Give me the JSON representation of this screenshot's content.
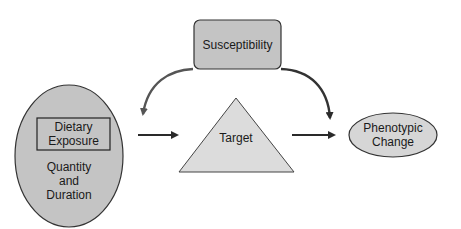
{
  "diagram": {
    "nodes": {
      "exposure": {
        "shape": "ellipse",
        "inner_box_label_line1": "Dietary",
        "inner_box_label_line2": "Exposure",
        "sub_label_line1": "Quantity",
        "sub_label_line2": "and",
        "sub_label_line3": "Duration"
      },
      "susceptibility": {
        "shape": "rounded-rectangle",
        "label": "Susceptibility"
      },
      "target": {
        "shape": "triangle",
        "label": "Target"
      },
      "phenotypic_change": {
        "shape": "ellipse",
        "label_line1": "Phenotypic",
        "label_line2": "Change"
      }
    },
    "edges": [
      {
        "from": "exposure",
        "to": "target",
        "style": "straight-arrow"
      },
      {
        "from": "target",
        "to": "phenotypic_change",
        "style": "straight-arrow"
      },
      {
        "from": "susceptibility",
        "to": "exposure-target-link",
        "style": "curved-arrow"
      },
      {
        "from": "susceptibility",
        "to": "target-phenotype-link",
        "style": "curved-arrow"
      }
    ],
    "colors": {
      "shape_fill": "#c8c8c8",
      "triangle_fill": "#dcdcdc",
      "stroke": "#333333",
      "arrow": "#2a2a2a",
      "curve_arrow": "#555555"
    }
  }
}
